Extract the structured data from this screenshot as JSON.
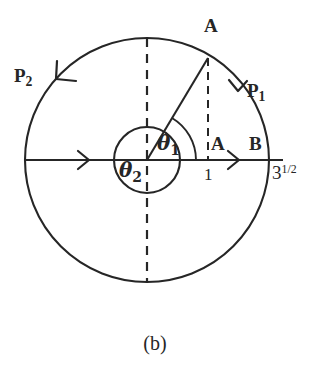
{
  "figure": {
    "caption": "(b)",
    "background_color": "#ffffff",
    "ink_color": "#262626",
    "geometry": {
      "center_x": 147,
      "center_y": 160,
      "outer_radius": 122,
      "inner_radius": 33,
      "point_a_x": 208,
      "point_a_y": 58,
      "radius_angle_degrees": 59
    },
    "labels": {
      "p2": {
        "base": "P",
        "subscript": "2"
      },
      "p1": {
        "base": "P",
        "subscript": "1"
      },
      "a_top": "A",
      "a_axis": "A",
      "b": "B",
      "unit": "1",
      "sqrt3": {
        "base": "3",
        "superscript": "1/2"
      },
      "theta1": {
        "base": "θ",
        "subscript": "1"
      },
      "theta2": {
        "base": "θ",
        "subscript": "2"
      }
    }
  }
}
